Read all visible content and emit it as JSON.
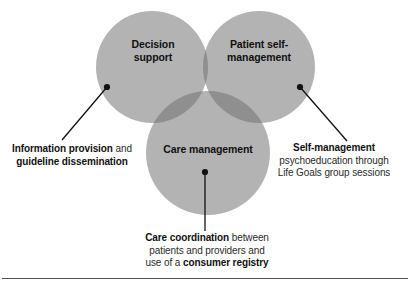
{
  "diagram": {
    "type": "venn-3-circle",
    "title": "",
    "circle_fill": "#b3b3b3",
    "overlap_fill": "#8f8f8f",
    "center_fill": "#7a7a7a",
    "leader_color": "#111111",
    "rule_color": "#4d4d4d",
    "circles": [
      {
        "id": "decision-support",
        "label": "Decision\nsupport",
        "cx": 152,
        "cy": 67,
        "r": 56
      },
      {
        "id": "patient-self-management",
        "label": "Patient self-\nmanagement",
        "cx": 259,
        "cy": 67,
        "r": 56
      },
      {
        "id": "care-management",
        "label": "Care management",
        "cx": 208,
        "cy": 153,
        "r": 62
      }
    ],
    "callouts": [
      {
        "id": "information-provision",
        "bold_lead": "Information provision",
        "rest": " and",
        "line2_bold": "guideline dissemination",
        "dot": {
          "x": 107,
          "y": 87
        },
        "line_end": {
          "x": 62,
          "y": 140
        }
      },
      {
        "id": "self-management",
        "bold_lead": "Self-management",
        "line2": "psychoeducation through",
        "line3": "Life Goals group sessions",
        "dot": {
          "x": 300,
          "y": 87
        },
        "line_end": {
          "x": 347,
          "y": 141
        }
      },
      {
        "id": "care-coordination",
        "bold_lead": "Care coordination",
        "rest": " between",
        "line2": "patients and providers and",
        "line3_pre": "use of a ",
        "line3_bold": "consumer registry",
        "dot": {
          "x": 205,
          "y": 172
        },
        "line_end": {
          "x": 205,
          "y": 231
        }
      }
    ]
  }
}
